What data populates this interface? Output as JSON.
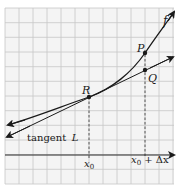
{
  "diagram": {
    "curve_label": "f",
    "tangent_label_prefix": "tangent",
    "tangent_label_var": "L",
    "points": [
      {
        "name": "R",
        "x": 89,
        "y": 97
      },
      {
        "name": "P",
        "x": 145,
        "y": 53
      },
      {
        "name": "Q",
        "x": 145,
        "y": 70
      }
    ],
    "x_labels": {
      "x0": "x",
      "x0_sub": "0",
      "x0dx_prefix": "x",
      "x0dx_sub": "0",
      "x0dx_suffix": " + Δx"
    },
    "colors": {
      "grid": "#c8c8c8",
      "curve": "#1a1a1a",
      "background": "#f4f4f4"
    }
  }
}
